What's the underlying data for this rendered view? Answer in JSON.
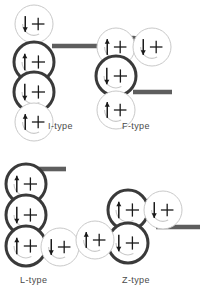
{
  "diagram": {
    "background_color": "#ffffff",
    "colors": {
      "circle_light_stroke": "#c9c9c9",
      "circle_bold_stroke": "#3a3a3a",
      "circle_fill": "#ffffff",
      "bar": "#5e5e5e",
      "joint": "#5e5e5e",
      "glyph": "#1a1a1a",
      "caption": "#4a4a4a"
    },
    "glyph_legend": {
      "plus": "+",
      "arrow_up": "spin-up-arrow",
      "arrow_down": "spin-down-arrow",
      "swirl": "curved-rotation-tail"
    },
    "figures": [
      {
        "id": "i-type",
        "label": "I-type",
        "caption_x": 48,
        "caption_y": 121,
        "origin_x": 8,
        "origin_y": 4,
        "bar": {
          "x1": 52,
          "y1": 46,
          "x2": 100,
          "y2": 46
        },
        "joints": [
          {
            "x": 34,
            "y": 46
          },
          {
            "x": 41,
            "y": 78
          },
          {
            "x": 34,
            "y": 108
          }
        ],
        "circles": [
          {
            "cx": 34,
            "cy": 24,
            "r": 19,
            "bold": false,
            "spin": "down"
          },
          {
            "cx": 34,
            "cy": 62,
            "r": 20,
            "bold": true,
            "spin": "up"
          },
          {
            "cx": 34,
            "cy": 92,
            "r": 20,
            "bold": true,
            "spin": "down"
          },
          {
            "cx": 34,
            "cy": 122,
            "r": 19,
            "bold": false,
            "spin": "up"
          }
        ]
      },
      {
        "id": "f-type",
        "label": "F-type",
        "caption_x": 122,
        "caption_y": 121,
        "origin_x": 8,
        "origin_y": 4,
        "bar": {
          "x1": 133,
          "y1": 92,
          "x2": 172,
          "y2": 92
        },
        "joints": [
          {
            "x": 133,
            "y": 40
          },
          {
            "x": 122,
            "y": 62
          },
          {
            "x": 112,
            "y": 92
          }
        ],
        "circles": [
          {
            "cx": 116,
            "cy": 47,
            "r": 19,
            "bold": false,
            "spin": "up"
          },
          {
            "cx": 152,
            "cy": 47,
            "r": 19,
            "bold": false,
            "spin": "down"
          },
          {
            "cx": 116,
            "cy": 76,
            "r": 20,
            "bold": true,
            "spin": "down"
          },
          {
            "cx": 116,
            "cy": 110,
            "r": 19,
            "bold": false,
            "spin": "up"
          }
        ]
      },
      {
        "id": "l-type",
        "label": "L-type",
        "caption_x": 20,
        "caption_y": 275,
        "origin_x": 8,
        "origin_y": 4,
        "bar": {
          "x1": 38,
          "y1": 169,
          "x2": 66,
          "y2": 169
        },
        "joints": [
          {
            "x": 24,
            "y": 198
          },
          {
            "x": 30,
            "y": 228
          },
          {
            "x": 50,
            "y": 243
          }
        ],
        "circles": [
          {
            "cx": 26,
            "cy": 184,
            "r": 20,
            "bold": true,
            "spin": "up"
          },
          {
            "cx": 26,
            "cy": 215,
            "r": 20,
            "bold": true,
            "spin": "down"
          },
          {
            "cx": 26,
            "cy": 246,
            "r": 20,
            "bold": true,
            "spin": "up"
          },
          {
            "cx": 60,
            "cy": 247,
            "r": 19,
            "bold": false,
            "spin": "down"
          }
        ]
      },
      {
        "id": "z-type",
        "label": "Z-type",
        "caption_x": 122,
        "caption_y": 275,
        "origin_x": 8,
        "origin_y": 4,
        "bar": {
          "x1": 156,
          "y1": 227,
          "x2": 200,
          "y2": 227
        },
        "joints": [
          {
            "x": 148,
            "y": 203
          },
          {
            "x": 135,
            "y": 228
          },
          {
            "x": 108,
            "y": 240
          }
        ],
        "circles": [
          {
            "cx": 128,
            "cy": 210,
            "r": 20,
            "bold": true,
            "spin": "up"
          },
          {
            "cx": 163,
            "cy": 210,
            "r": 19,
            "bold": false,
            "spin": "down"
          },
          {
            "cx": 128,
            "cy": 243,
            "r": 20,
            "bold": true,
            "spin": "down"
          },
          {
            "cx": 95,
            "cy": 240,
            "r": 19,
            "bold": false,
            "spin": "up"
          }
        ]
      }
    ]
  }
}
